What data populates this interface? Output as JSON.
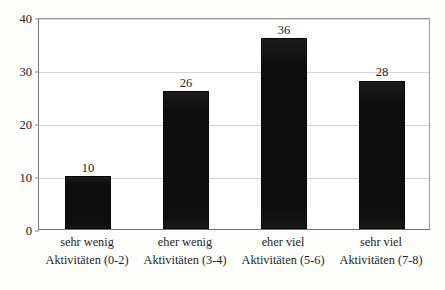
{
  "figure": {
    "title_artifact": "...",
    "background_color": "#fdfdfc",
    "bar_color": "#100f0f",
    "gridline_color": "#d7d7d7",
    "axis_color": "#6f6f6f",
    "text_color": "#232323"
  },
  "chart_data": {
    "type": "bar",
    "title": "",
    "xlabel": "",
    "ylabel": "",
    "categories": [
      "sehr wenig Aktivitäten (0-2)",
      "eher wenig Aktivitäten (3-4)",
      "eher viel Aktivitäten (5-6)",
      "sehr viel Aktivitäten (7-8)"
    ],
    "category_lines": [
      {
        "line1": "sehr wenig",
        "line2": "Aktivitäten (0-2)"
      },
      {
        "line1": "eher wenig",
        "line2": "Aktivitäten (3-4)"
      },
      {
        "line1": "eher viel",
        "line2": "Aktivitäten (5-6)"
      },
      {
        "line1": "sehr viel",
        "line2": "Aktivitäten (7-8)"
      }
    ],
    "values": [
      10,
      26,
      36,
      28
    ],
    "value_labels": [
      "10",
      "26",
      "36",
      "28"
    ],
    "ylim": [
      0,
      40
    ],
    "yticks": [
      0,
      10,
      20,
      30,
      40
    ],
    "ytick_labels": [
      "0",
      "10",
      "20",
      "30",
      "40"
    ],
    "grid": true,
    "grid_axis": "y",
    "legend": false,
    "legend_position": "none"
  }
}
